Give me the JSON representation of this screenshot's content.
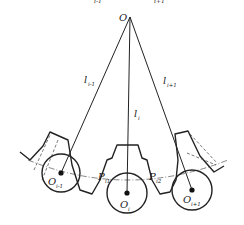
{
  "diagram": {
    "type": "mechanism-geometry",
    "top_cropped_labels": [
      "i-1",
      "i+1"
    ],
    "apex": {
      "label": "O",
      "x": 130,
      "y": 17
    },
    "rays": [
      {
        "label": "l",
        "subscript": "i-1",
        "to": "O_i-1"
      },
      {
        "label": "l",
        "subscript": "i",
        "to": "O_i"
      },
      {
        "label": "l",
        "subscript": "i+1",
        "to": "O_i+1"
      }
    ],
    "rollers": [
      {
        "label": "O",
        "subscript": "i-1",
        "cx": 61,
        "cy": 173,
        "r": 19
      },
      {
        "label": "O",
        "subscript": "i",
        "cx": 127,
        "cy": 193,
        "r": 20
      },
      {
        "label": "O",
        "subscript": "i+1",
        "cx": 192,
        "cy": 190,
        "r": 20
      }
    ],
    "points": [
      {
        "label": "P",
        "subscript": "i1"
      },
      {
        "label": "P",
        "subscript": "i2"
      }
    ],
    "colors": {
      "line": "#222222",
      "dash": "#555555",
      "background": "#ffffff"
    }
  }
}
